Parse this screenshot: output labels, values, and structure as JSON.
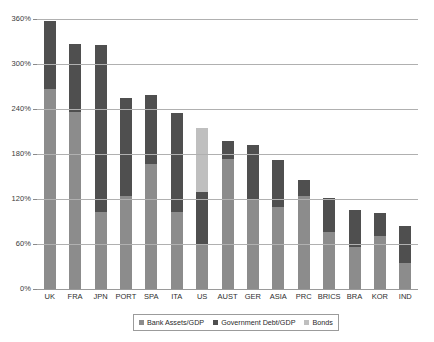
{
  "chart_data": {
    "type": "bar",
    "stacked": true,
    "title": "",
    "subtitle": "",
    "xlabel": "",
    "ylabel": "",
    "ylim": [
      0,
      360
    ],
    "ytick_values": [
      0,
      60,
      120,
      180,
      240,
      300,
      360
    ],
    "ytick_labels": [
      "0%",
      "60%",
      "120%",
      "180%",
      "240%",
      "300%",
      "360%"
    ],
    "grid": true,
    "legend_position": "bottom",
    "categories": [
      "UK",
      "FRA",
      "JPN",
      "PORT",
      "SPA",
      "ITA",
      "US",
      "AUST",
      "GER",
      "ASIA",
      "PRC",
      "BRICS",
      "BRA",
      "KOR",
      "IND"
    ],
    "series": [
      {
        "name": "Bank Assets/GDP",
        "color": "#8c8c8c",
        "values": [
          267,
          236,
          103,
          124,
          167,
          103,
          60,
          173,
          119,
          110,
          124,
          76,
          56,
          71,
          35
        ]
      },
      {
        "name": "Government Debt/GDP",
        "color": "#4f4f4f",
        "values": [
          90,
          91,
          222,
          131,
          92,
          132,
          69,
          24,
          73,
          62,
          21,
          45,
          49,
          30,
          49
        ]
      },
      {
        "name": "Bonds",
        "color": "#bfbfbf",
        "values": [
          0,
          0,
          0,
          0,
          0,
          0,
          86,
          0,
          0,
          0,
          0,
          0,
          0,
          0,
          0
        ]
      }
    ],
    "totals": [
      357,
      327,
      325,
      255,
      259,
      235,
      215,
      197,
      192,
      172,
      145,
      121,
      105,
      101,
      84
    ]
  },
  "legend": {
    "items": [
      {
        "label": "Bank Assets/GDP",
        "swatch_class": "sw-bank"
      },
      {
        "label": "Government Debt/GDP",
        "swatch_class": "sw-debt"
      },
      {
        "label": "Bonds",
        "swatch_class": "sw-bonds"
      }
    ]
  }
}
